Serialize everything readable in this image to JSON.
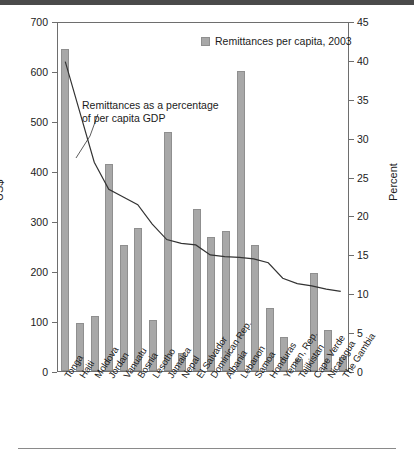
{
  "chart_data": {
    "type": "bar",
    "title": "",
    "subtitle": "",
    "categories": [
      "Tonga",
      "Haiti",
      "Moldova",
      "Jordan",
      "Vanuatu",
      "Bosnia",
      "Lesotho",
      "Jamaica",
      "Nepal",
      "El Salvador",
      "Dominican Rep.",
      "Albania",
      "Lebanon",
      "Samoa",
      "Honduras",
      "Yemen, Rep.",
      "Tajikistan",
      "Cape Verde",
      "Nicaragua",
      "The Gambia"
    ],
    "series": [
      {
        "name": "Remittances per capita, 2003",
        "type": "bar",
        "axis": "left",
        "unit": "US$",
        "values": [
          645,
          96,
          110,
          415,
          253,
          286,
          103,
          478,
          37,
          325,
          268,
          281,
          601,
          253,
          126,
          68,
          25,
          196,
          82,
          28
        ]
      },
      {
        "name": "Remittances as a percentage of per capita GDP",
        "type": "line",
        "axis": "right",
        "unit": "Percent",
        "values": [
          40.0,
          33.5,
          27.0,
          23.5,
          22.5,
          21.5,
          19.0,
          17.0,
          16.5,
          16.3,
          15.0,
          14.8,
          14.7,
          14.5,
          14.0,
          12.0,
          11.3,
          11.0,
          10.6,
          10.3
        ]
      }
    ],
    "xlabel": "",
    "ylabel_left": "US$",
    "ylabel_right": "Percent",
    "ylim_left": [
      0,
      700
    ],
    "ylim_right": [
      0,
      45
    ],
    "yticks_left": [
      0,
      100,
      200,
      300,
      400,
      500,
      600,
      700
    ],
    "yticks_right": [
      0,
      5,
      10,
      15,
      20,
      25,
      30,
      35,
      40,
      45
    ],
    "grid": false,
    "legend_position": "top-right",
    "legend_entries": [
      "Remittances per capita, 2003"
    ],
    "annotations": [
      {
        "text_line1": "Remittances as a percentage",
        "text_line2": "of per capita GDP"
      }
    ],
    "colors": {
      "bar_fill": "#a8a8a8",
      "bar_stroke": "#8f8f8f",
      "line": "#333333",
      "axis": "#6e6e6e",
      "text": "#1b1b1b"
    }
  }
}
